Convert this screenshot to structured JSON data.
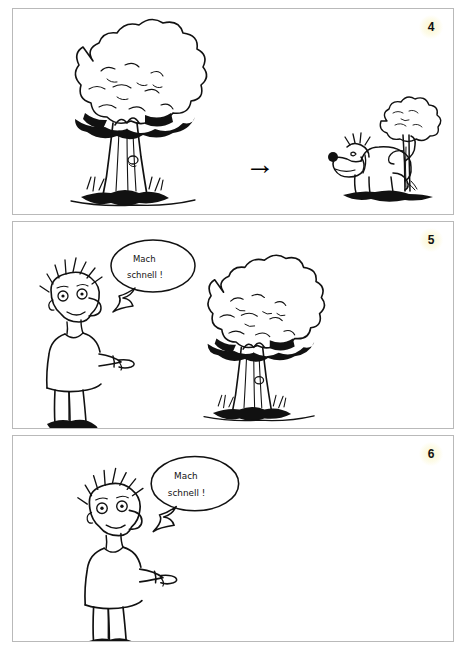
{
  "document": {
    "type": "comic-worksheet",
    "language": "German",
    "panel_count": 3
  },
  "panels": [
    {
      "number": "4",
      "badge_color": "#fbf6cf",
      "scene_left": {
        "items": [
          "big-tree"
        ],
        "label": "Großer Baum"
      },
      "operator": "",
      "arrow": "→",
      "scene_right": {
        "items": [
          "dog",
          "small-tree"
        ],
        "label": "Hund am Baum"
      },
      "speech": null
    },
    {
      "number": "5",
      "badge_color": "#fbf6cf",
      "scene_left": {
        "items": [
          "boy",
          "speech-bubble"
        ],
        "label": "Junge zeigt"
      },
      "operator": "+",
      "scene_middle": {
        "items": [
          "big-tree"
        ],
        "label": "Großer Baum"
      },
      "arrow": "→",
      "scene_right": {
        "items": [
          "dog",
          "small-tree"
        ],
        "label": "Hund am Baum"
      },
      "speech": {
        "line1": "Mach",
        "line2": "schnell !"
      }
    },
    {
      "number": "6",
      "badge_color": "#fbf6cf",
      "scene_left": {
        "items": [
          "boy",
          "speech-bubble"
        ],
        "label": "Junge zeigt"
      },
      "operator": "",
      "arrow": "→",
      "scene_right": {
        "items": [
          "dog"
        ],
        "label": "Hund"
      },
      "speech": {
        "line1": "Mach",
        "line2": "schnell !"
      }
    }
  ],
  "symbols": {
    "arrow_glyph": "→",
    "plus_glyph": "+"
  },
  "colors": {
    "ink": "#111111",
    "panel_border": "#b9b9b9",
    "background": "#ffffff",
    "badge_glow": "#fbf6cf"
  }
}
